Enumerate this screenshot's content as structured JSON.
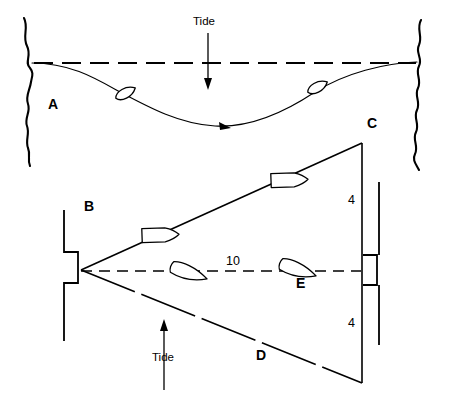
{
  "figure": {
    "stroke_color": "#000000",
    "background_color": "#ffffff"
  },
  "upper_diagram": {
    "name": "single-leg-tidal-drift",
    "point_labels": [
      {
        "id": "A",
        "text": "A",
        "x": 48,
        "y": 104
      }
    ],
    "tide_label": {
      "text": "Tide",
      "x": 193,
      "y": 22
    },
    "tide_direction": "downward",
    "ground_track_style": "dashed",
    "water_track_style": "solid-curve",
    "boats": [
      {
        "id": "upper-boat-1",
        "x": 126,
        "y": 94,
        "rotation": -28
      },
      {
        "id": "upper-boat-2",
        "x": 318,
        "y": 88,
        "rotation": -28
      }
    ]
  },
  "lower_diagram": {
    "name": "triangle-tidal-crossing",
    "point_labels": [
      {
        "id": "B",
        "text": "B",
        "x": 84,
        "y": 206
      },
      {
        "id": "C",
        "text": "C",
        "x": 367,
        "y": 123
      },
      {
        "id": "D",
        "text": "D",
        "x": 256,
        "y": 355
      },
      {
        "id": "E",
        "text": "E",
        "x": 296,
        "y": 283
      }
    ],
    "distance_labels": [
      {
        "id": "bc-upper-depth",
        "text": "4",
        "x": 348,
        "y": 200
      },
      {
        "id": "bd-lower-depth",
        "text": "4",
        "x": 348,
        "y": 323
      },
      {
        "id": "be-distance",
        "text": "10",
        "x": 226,
        "y": 261
      }
    ],
    "tide_label": {
      "text": "Tide",
      "x": 152,
      "y": 357
    },
    "tide_direction": "upward",
    "centre_line_style": "dashed",
    "leg_bc_style": "solid",
    "leg_bd_style": "long-dashed",
    "boats": [
      {
        "id": "lower-boat-bc-1",
        "x": 159,
        "y": 235,
        "rotation": -2
      },
      {
        "id": "lower-boat-bc-2",
        "x": 288,
        "y": 180,
        "rotation": -2
      },
      {
        "id": "lower-boat-be-1",
        "x": 189,
        "y": 273,
        "rotation": 18
      },
      {
        "id": "lower-boat-be-2",
        "x": 298,
        "y": 270,
        "rotation": 18
      }
    ]
  }
}
